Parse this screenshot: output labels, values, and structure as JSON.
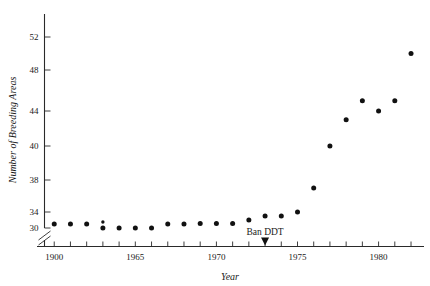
{
  "chart_data": {
    "type": "scatter",
    "title": "",
    "xlabel": "Year",
    "ylabel": "Number of Breeding Areas",
    "xlim": [
      1959.4,
      1982.8
    ],
    "ylim": [
      29.0,
      53.6
    ],
    "grid": false,
    "legend": null,
    "y_axis_broken": true,
    "y_break_at": 30,
    "x_tick_years": [
      1960,
      1961,
      1962,
      1963,
      1964,
      1965,
      1966,
      1967,
      1968,
      1969,
      1970,
      1971,
      1972,
      1973,
      1974,
      1975,
      1976,
      1977,
      1978,
      1979,
      1980,
      1981,
      1982
    ],
    "x_tick_labels": [
      {
        "value": 1960,
        "label": "1900"
      },
      {
        "value": 1965,
        "label": "1965"
      },
      {
        "value": 1970,
        "label": "1970"
      },
      {
        "value": 1975,
        "label": "1975"
      },
      {
        "value": 1980,
        "label": "1980"
      }
    ],
    "y_tick_labels": [
      {
        "value": 30,
        "label": "30"
      },
      {
        "value": 34,
        "label": "34"
      },
      {
        "value": 38,
        "label": "38"
      },
      {
        "value": 40,
        "label": "40"
      },
      {
        "value": 44,
        "label": "44"
      },
      {
        "value": 48,
        "label": "48"
      },
      {
        "value": 52,
        "label": "52"
      }
    ],
    "x": [
      1960,
      1961,
      1962,
      1963,
      1963,
      1964,
      1965,
      1966,
      1967,
      1968,
      1969,
      1970,
      1971,
      1972,
      1973,
      1974,
      1975,
      1976,
      1977,
      1978,
      1979,
      1980,
      1981,
      1982
    ],
    "y": [
      31,
      31,
      31,
      31.5,
      30,
      30,
      30,
      30,
      31,
      31,
      31.1,
      31.1,
      31.1,
      32,
      33,
      33,
      34,
      37,
      40,
      43,
      45,
      44,
      45,
      50
    ],
    "points": [
      {
        "x": 1960,
        "y": 31
      },
      {
        "x": 1961,
        "y": 31
      },
      {
        "x": 1962,
        "y": 31
      },
      {
        "x": 1963,
        "y": 31.5
      },
      {
        "x": 1963,
        "y": 30
      },
      {
        "x": 1964,
        "y": 30
      },
      {
        "x": 1965,
        "y": 30
      },
      {
        "x": 1966,
        "y": 30
      },
      {
        "x": 1967,
        "y": 31
      },
      {
        "x": 1968,
        "y": 31
      },
      {
        "x": 1969,
        "y": 31.1
      },
      {
        "x": 1970,
        "y": 31.1
      },
      {
        "x": 1971,
        "y": 31.1
      },
      {
        "x": 1972,
        "y": 32
      },
      {
        "x": 1973,
        "y": 33
      },
      {
        "x": 1974,
        "y": 33
      },
      {
        "x": 1975,
        "y": 34
      },
      {
        "x": 1976,
        "y": 37
      },
      {
        "x": 1977,
        "y": 40
      },
      {
        "x": 1978,
        "y": 43
      },
      {
        "x": 1979,
        "y": 45
      },
      {
        "x": 1980,
        "y": 44
      },
      {
        "x": 1981,
        "y": 45
      },
      {
        "x": 1982,
        "y": 50
      }
    ],
    "annotations": [
      {
        "name": "ban-ddt",
        "label": "Ban DDT",
        "x": 1973,
        "marker": "down-arrow"
      }
    ]
  }
}
